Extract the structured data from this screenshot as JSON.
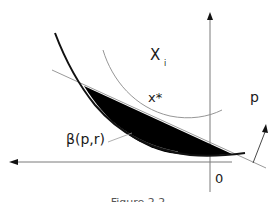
{
  "figure": {
    "labels": {
      "set_label": "X",
      "set_subscript": "i",
      "point_label": "x*",
      "region_label": "β(p,r)",
      "origin_label": "0",
      "vector_label": "p"
    },
    "caption": "Figure 2.2",
    "colors": {
      "curve": "#111111",
      "tangent": "#9a9a9a",
      "arc": "#8a8a8a",
      "region_fill": "#000000",
      "axes": "#7a7a7a"
    }
  }
}
